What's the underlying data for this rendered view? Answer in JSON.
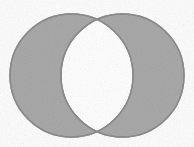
{
  "figure": {
    "name": "venn-diagram-two-sets",
    "canvas_width": 194,
    "canvas_height": 147,
    "background_color": "#fdfdfd"
  },
  "style": {
    "fill_color": "#a9a9a9",
    "intersection_fill_color": "#ffffff",
    "outline_color": "#8c8c8c",
    "outline_width": 1.4,
    "texture": "faint-scan-noise"
  },
  "chart_data": {
    "type": "diagram",
    "subtype": "venn",
    "title": "",
    "sets": [
      {
        "name": "left-set",
        "label": "",
        "shape": "circle",
        "cx": 71.5,
        "cy": 75.5,
        "r": 61.5,
        "fill": "#a9a9a9",
        "stroke": "#8c8c8c"
      },
      {
        "name": "right-set",
        "label": "",
        "shape": "circle",
        "cx": 122.5,
        "cy": 75.5,
        "r": 61.5,
        "fill": "#a9a9a9",
        "stroke": "#8c8c8c"
      }
    ],
    "intersection": {
      "name": "lens-region",
      "label": "",
      "fill": "#ffffff",
      "stroke": "#8c8c8c",
      "x_extent": [
        68,
        128
      ],
      "y_extent": [
        22,
        129
      ],
      "crossing_points": [
        {
          "x": 97,
          "y": 22
        },
        {
          "x": 97,
          "y": 129
        }
      ]
    },
    "legend": null,
    "annotations": []
  }
}
